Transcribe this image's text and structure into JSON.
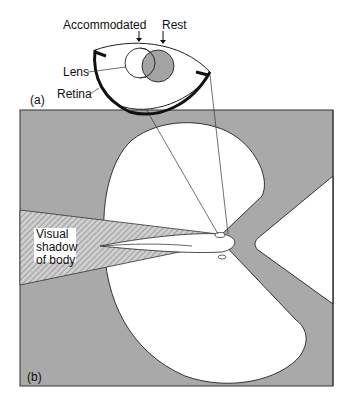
{
  "figure": {
    "panel_a": {
      "label": "(a)",
      "annotations": {
        "accommodated": "Accommodated",
        "rest": "Rest",
        "lens": "Lens",
        "retina": "Retina"
      }
    },
    "panel_b": {
      "label": "(b)",
      "shadow_label_lines": [
        "Visual",
        "shadow",
        "of body"
      ]
    },
    "colors": {
      "background": "#ffffff",
      "gray_region": "#a9a9a9",
      "outline": "#222222",
      "lens_rest_fill": "#9a9a9a",
      "hatch": "#7a7a7a"
    }
  }
}
